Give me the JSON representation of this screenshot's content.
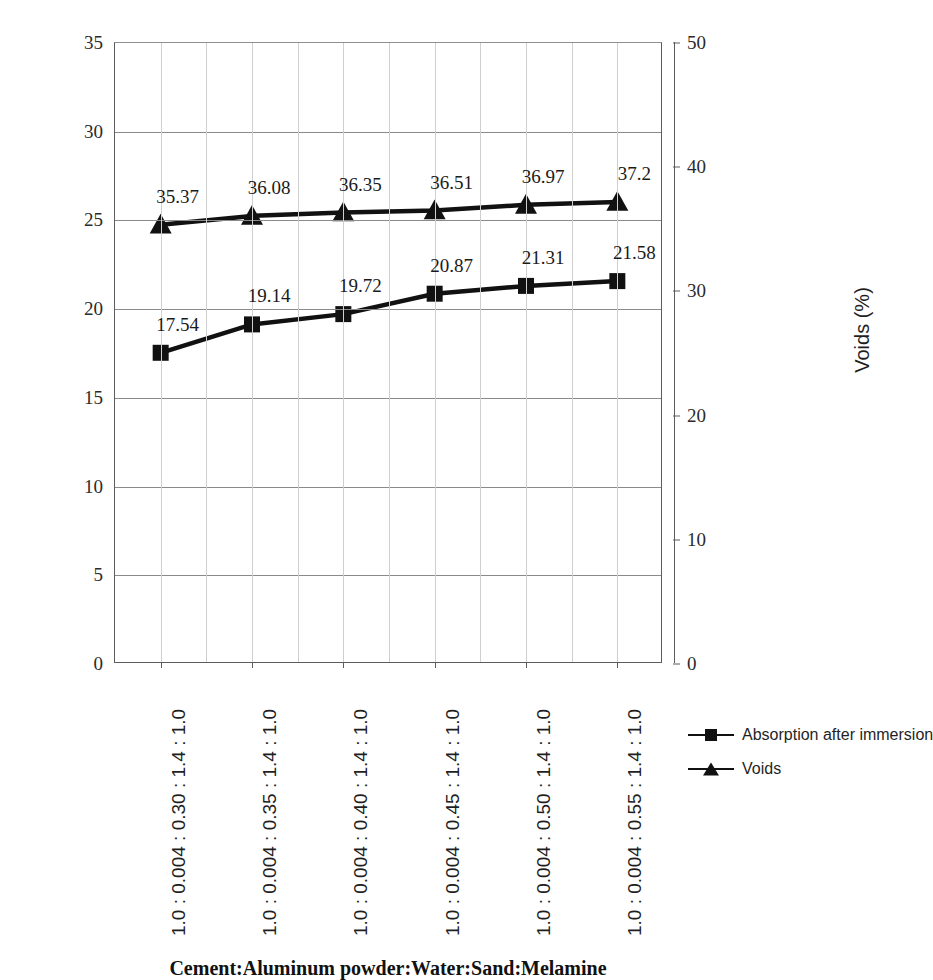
{
  "chart_data": {
    "type": "line",
    "title": "",
    "xlabel": "Cement:Aluminum powder:Water:Sand:Melamine",
    "categories": [
      "1.0 : 0.004 : 0.30 : 1.4 : 1.0",
      "1.0 : 0.004 : 0.35 : 1.4 : 1.0",
      "1.0 : 0.004 : 0.40 : 1.4 : 1.0",
      "1.0 : 0.004 : 0.45 : 1.4 : 1.0",
      "1.0 : 0.004 : 0.50 : 1.4 : 1.0",
      "1.0 : 0.004 : 0.55 : 1.4 : 1.0"
    ],
    "series": [
      {
        "name": "Absorption after immersion",
        "axis": "left",
        "marker": "square",
        "color": "#111111",
        "values": [
          17.54,
          19.14,
          19.72,
          20.87,
          21.31,
          21.58
        ],
        "labels": [
          "17.54",
          "19.14",
          "19.72",
          "20.87",
          "21.31",
          "21.58"
        ]
      },
      {
        "name": "Voids",
        "axis": "right",
        "marker": "triangle",
        "color": "#111111",
        "values": [
          35.37,
          36.08,
          36.35,
          36.51,
          36.97,
          37.2
        ],
        "labels": [
          "35.37",
          "36.08",
          "36.35",
          "36.51",
          "36.97",
          "37.2"
        ]
      }
    ],
    "left_axis": {
      "label": "Absorption after immersion (%)",
      "min": 0,
      "max": 35,
      "tick_step": 5,
      "ticks": [
        "0",
        "5",
        "10",
        "15",
        "20",
        "25",
        "30",
        "35"
      ]
    },
    "right_axis": {
      "label": "Voids (%)",
      "min": 0,
      "max": 50,
      "tick_step": 10,
      "ticks": [
        "0",
        "10",
        "20",
        "30",
        "40",
        "50"
      ]
    },
    "grid": {
      "horizontal": true,
      "vertical": true
    },
    "legend": {
      "position": "right",
      "entries": [
        {
          "label": "Absorption after immersion",
          "marker": "square"
        },
        {
          "label": "Voids",
          "marker": "triangle"
        }
      ]
    }
  }
}
